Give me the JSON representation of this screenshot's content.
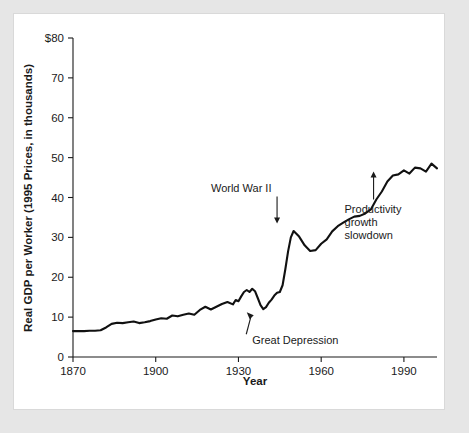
{
  "figure": {
    "panel_background": "#ffffff",
    "outer_background": "#e6e6e6",
    "line_color": "#111111",
    "text_color": "#1a1a1a"
  },
  "chart_data": {
    "type": "line",
    "title": "",
    "subtitle": "",
    "xlabel": "Year",
    "ylabel": "Real GDP per Worker (1995 Prices, in thousands)",
    "xlim": [
      1870,
      2002
    ],
    "ylim": [
      0,
      80
    ],
    "grid": false,
    "legend": null,
    "x_ticks": [
      1870,
      1900,
      1930,
      1960,
      1990
    ],
    "x_tick_labels": [
      "1870",
      "1900",
      "1930",
      "1960",
      "1990"
    ],
    "y_ticks": [
      0,
      10,
      20,
      30,
      40,
      50,
      60,
      70,
      80
    ],
    "y_tick_labels": [
      "0",
      "10",
      "20",
      "30",
      "40",
      "50",
      "60",
      "70",
      "$80"
    ],
    "series": [
      {
        "name": "Real GDP per Worker",
        "x": [
          1870,
          1872,
          1874,
          1876,
          1878,
          1880,
          1882,
          1884,
          1886,
          1888,
          1890,
          1892,
          1894,
          1896,
          1898,
          1900,
          1902,
          1904,
          1906,
          1908,
          1910,
          1912,
          1914,
          1916,
          1918,
          1920,
          1922,
          1924,
          1926,
          1928,
          1929,
          1930,
          1931,
          1932,
          1933,
          1934,
          1935,
          1936,
          1937,
          1938,
          1939,
          1940,
          1941,
          1942,
          1943,
          1944,
          1945,
          1946,
          1947,
          1948,
          1949,
          1950,
          1952,
          1954,
          1956,
          1958,
          1960,
          1962,
          1964,
          1966,
          1968,
          1970,
          1972,
          1974,
          1976,
          1978,
          1980,
          1982,
          1984,
          1986,
          1988,
          1990,
          1992,
          1994,
          1996,
          1998,
          2000,
          2002
        ],
        "values": [
          6.5,
          6.5,
          6.5,
          6.6,
          6.6,
          6.7,
          7.4,
          8.3,
          8.6,
          8.5,
          8.7,
          8.9,
          8.5,
          8.7,
          9.0,
          9.4,
          9.7,
          9.6,
          10.4,
          10.2,
          10.6,
          10.9,
          10.6,
          11.8,
          12.6,
          11.9,
          12.6,
          13.3,
          13.8,
          13.2,
          14.3,
          14.0,
          15.2,
          16.3,
          16.8,
          16.3,
          17.1,
          16.5,
          14.8,
          13.0,
          12.0,
          12.5,
          13.6,
          14.4,
          15.4,
          16.1,
          16.3,
          18.0,
          22.0,
          26.5,
          30.0,
          31.6,
          30.2,
          28.0,
          26.6,
          26.8,
          28.4,
          29.5,
          31.5,
          32.8,
          33.7,
          34.5,
          35.2,
          35.4,
          36.0,
          37.0,
          39.5,
          41.5,
          44.0,
          45.5,
          45.8,
          46.8,
          46.0,
          47.5,
          47.3,
          46.5,
          48.5,
          47.3
        ]
      }
    ],
    "annotations": [
      {
        "id": "world-war-ii",
        "text": "World War II",
        "text_x": 1931,
        "text_y": 41.5,
        "point_x": 1944,
        "point_y": 33.5,
        "arrow": "down"
      },
      {
        "id": "productivity-growth-slowdown",
        "lines": [
          "Productivity",
          "growth",
          "slowdown"
        ],
        "text": "Productivity growth slowdown",
        "text_x": 1975,
        "text_y": 36.0,
        "point_x": 1979,
        "point_y": 46.5,
        "arrow": "up"
      },
      {
        "id": "great-depression",
        "text": "Great Depression",
        "text_x": 1935,
        "text_y": 3.2,
        "point_x": 1933,
        "point_y": 11.2,
        "arrow": "diagonal-up-left"
      }
    ]
  }
}
